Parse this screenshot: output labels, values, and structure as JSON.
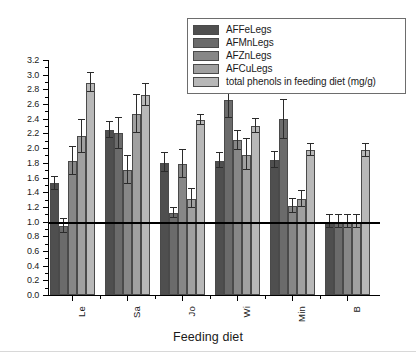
{
  "chart_data": {
    "type": "bar",
    "title": "",
    "subtitle": "",
    "xlabel": "Feeding diet",
    "ylabel": "",
    "categories": [
      "Le",
      "Sa",
      "Jo",
      "Wi",
      "Min",
      "B"
    ],
    "ylim": [
      0.0,
      3.2
    ],
    "ytick_step": 0.2,
    "yticks": [
      "0.0",
      "0.2",
      "0.4",
      "0.6",
      "0.8",
      "1.0",
      "1.2",
      "1.4",
      "1.6",
      "1.8",
      "2.0",
      "2.2",
      "2.4",
      "2.6",
      "2.8",
      "3.0",
      "3.2"
    ],
    "grid": false,
    "legend_position": "top-right",
    "reference_line": {
      "value": 1.0,
      "label": "",
      "color": "#000000"
    },
    "series": [
      {
        "name": "AFFeLegs",
        "color": "#4f4f4f",
        "values": [
          1.52,
          2.25,
          1.8,
          1.83,
          1.84,
          1.0
        ],
        "errors": [
          0.09,
          0.11,
          0.13,
          0.1,
          0.11,
          0.09
        ]
      },
      {
        "name": "AFMnLegs",
        "color": "#6b6b6b",
        "values": [
          0.94,
          2.2,
          1.12,
          2.66,
          2.39,
          1.0
        ],
        "errors": [
          0.09,
          0.21,
          0.07,
          0.25,
          0.26,
          0.09
        ]
      },
      {
        "name": "AFZnLegs",
        "color": "#878787",
        "values": [
          1.82,
          1.7,
          1.79,
          2.11,
          1.21,
          1.0
        ],
        "errors": [
          0.19,
          0.19,
          0.19,
          0.13,
          0.1,
          0.09
        ]
      },
      {
        "name": "AFCuLegs",
        "color": "#a0a0a0",
        "values": [
          2.16,
          2.47,
          1.31,
          1.91,
          1.31,
          1.0
        ],
        "errors": [
          0.22,
          0.26,
          0.13,
          0.21,
          0.11,
          0.09
        ]
      },
      {
        "name": "total phenols in feeding diet (mg/g)",
        "color": "#b8b8b8",
        "values": [
          2.89,
          2.72,
          2.38,
          2.3,
          1.97,
          1.97
        ],
        "errors": [
          0.13,
          0.15,
          0.07,
          0.09,
          0.08,
          0.09
        ]
      }
    ]
  },
  "legend": {
    "items": [
      {
        "label": "AFFeLegs"
      },
      {
        "label": "AFMnLegs"
      },
      {
        "label": "AFZnLegs"
      },
      {
        "label": "AFCuLegs"
      },
      {
        "label": "total phenols in feeding diet (mg/g)"
      }
    ]
  },
  "axes": {
    "x_title": "Feeding diet"
  }
}
